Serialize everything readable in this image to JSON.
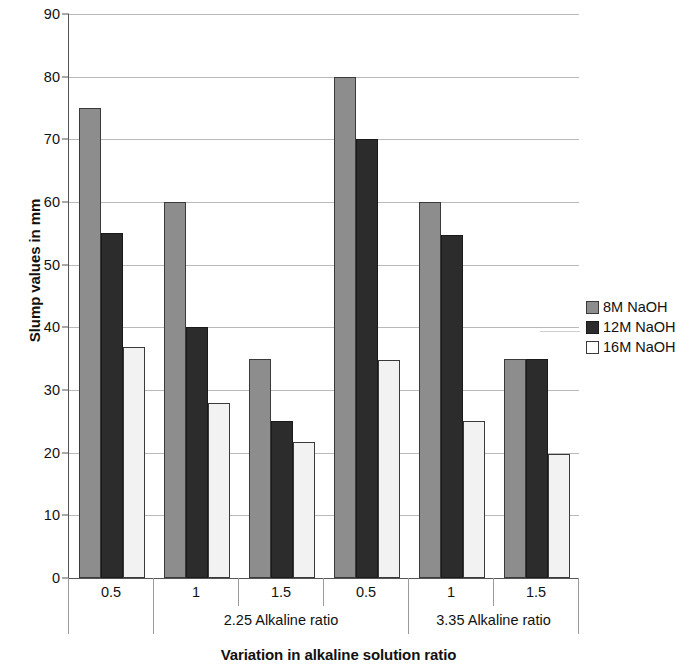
{
  "chart_data": {
    "type": "bar",
    "title": "",
    "xlabel": "Variation in alkaline solution ratio",
    "ylabel": "Slump values in mm",
    "ylim": [
      0,
      90
    ],
    "ytick_step": 10,
    "yticks": [
      "0",
      "10",
      "20",
      "30",
      "40",
      "50",
      "60",
      "70",
      "80",
      "90"
    ],
    "grid": true,
    "legend_position": "right",
    "categories": [
      "0.5",
      "1",
      "1.5",
      "0.5",
      "1",
      "1.5"
    ],
    "group_labels": [
      "",
      "2.25 Alkaline ratio",
      "3.35 Alkaline ratio"
    ],
    "groups": [
      {
        "label": "2.25 Alkaline ratio",
        "categories": [
          "0.5",
          "1",
          "1.5"
        ]
      },
      {
        "label": "3.35 Alkaline ratio",
        "categories": [
          "0.5",
          "1",
          "1.5"
        ]
      }
    ],
    "series": [
      {
        "name": "8M NaOH",
        "color": "#8d8d8d",
        "values": [
          75,
          60,
          35,
          80,
          60,
          35
        ]
      },
      {
        "name": "12M NaOH",
        "color": "#2c2c2c",
        "values": [
          55,
          40,
          25,
          70,
          54.8,
          35
        ]
      },
      {
        "name": "16M NaOH",
        "color": "#f2f2f2",
        "values": [
          36.8,
          28,
          21.7,
          34.8,
          25,
          19.8
        ]
      }
    ]
  },
  "legend": {
    "entries": [
      {
        "label": "8M NaOH"
      },
      {
        "label": "12M NaOH"
      },
      {
        "label": "16M NaOH"
      }
    ]
  },
  "axes": {
    "y_title": "Slump values in mm",
    "x_title": "Variation in alkaline solution ratio"
  }
}
